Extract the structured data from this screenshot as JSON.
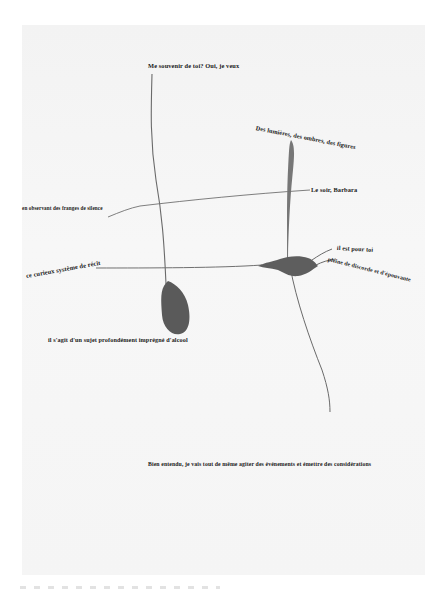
{
  "page": {
    "background": "#ffffff",
    "paper_color": "#f5f5f5",
    "ink_color": "#555555",
    "blob_color": "#5a5a5a"
  },
  "labels": [
    {
      "id": "souvenir",
      "text": "Me souvenir de toi? Oui, je veux"
    },
    {
      "id": "lumieres",
      "text": "Des lumières, des ombres, des figures"
    },
    {
      "id": "franges",
      "text": "en observant des franges de silence"
    },
    {
      "id": "soir",
      "text": "Le soir, Barbara"
    },
    {
      "id": "recit",
      "text": "ce curieux système de récit"
    },
    {
      "id": "pourtoi",
      "text": "il est pour toi"
    },
    {
      "id": "discorde",
      "text": "pleine de discorde et d'épouvante"
    },
    {
      "id": "alcool",
      "text": "il s'agit d'un sujet profondément imprégné d'alcool"
    },
    {
      "id": "entendu",
      "text": "Bien entendu, je vais tout de même agiter des événements et émettre des considérations"
    }
  ]
}
